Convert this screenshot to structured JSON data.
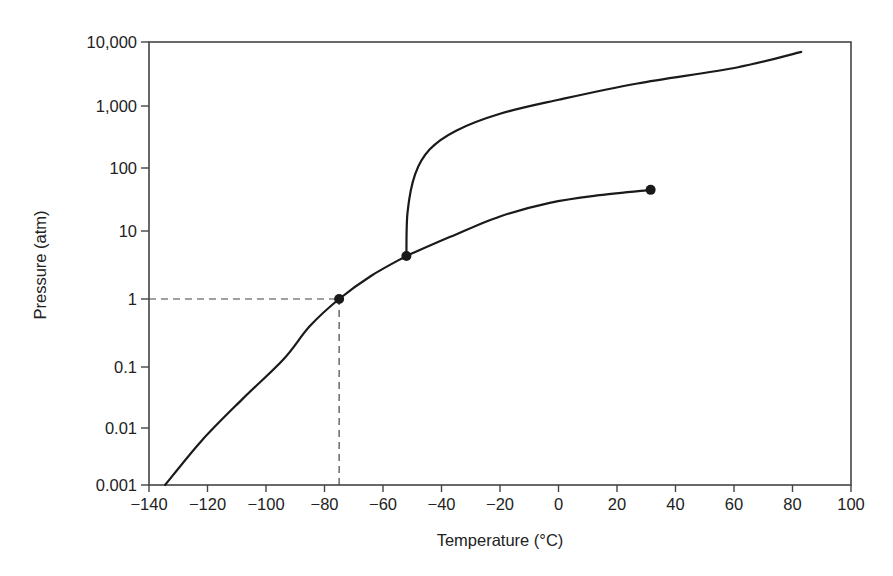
{
  "chart_data": {
    "type": "line",
    "title": "",
    "xlabel": "Temperature (°C)",
    "ylabel": "Pressure (atm)",
    "xlim": [
      -140,
      100
    ],
    "ylim": [
      0.001,
      10000
    ],
    "yscale": "log",
    "grid": false,
    "legend": null,
    "x_ticks": [
      -140,
      -120,
      -100,
      -80,
      -60,
      -40,
      -20,
      0,
      20,
      40,
      60,
      80,
      100
    ],
    "x_tick_labels": [
      "−140",
      "−120",
      "−100",
      "−80",
      "−60",
      "−40",
      "−20",
      "0",
      "20",
      "40",
      "60",
      "80",
      "100"
    ],
    "y_ticks": [
      0.001,
      0.01,
      0.1,
      1,
      10,
      100,
      1000,
      10000
    ],
    "y_tick_labels": [
      "0.001",
      "0.01",
      "0.1",
      "1",
      "10",
      "100",
      "1,000",
      "10,000"
    ],
    "series": [
      {
        "name": "Sublimation curve (solid–gas)",
        "points": [
          [
            -134.5,
            0.001
          ],
          [
            -122,
            0.006
          ],
          [
            -108,
            0.03
          ],
          [
            -94,
            0.13
          ],
          [
            -85,
            0.4
          ],
          [
            -75,
            1
          ],
          [
            -64,
            2.2
          ],
          [
            -52,
            4.3
          ]
        ]
      },
      {
        "name": "Vaporization curve (liquid–gas)",
        "points": [
          [
            -52,
            4.3
          ],
          [
            -37,
            8.2
          ],
          [
            -20,
            17
          ],
          [
            -3,
            28
          ],
          [
            14,
            37
          ],
          [
            31.5,
            45
          ]
        ]
      },
      {
        "name": "Melting curve (solid–liquid)",
        "points": [
          [
            -52,
            4.3
          ],
          [
            -51.6,
            20
          ],
          [
            -49,
            80
          ],
          [
            -44,
            200
          ],
          [
            -35,
            400
          ],
          [
            -20,
            750
          ],
          [
            0,
            1250
          ],
          [
            27,
            2250
          ],
          [
            61,
            4000
          ],
          [
            83,
            7000
          ]
        ]
      }
    ],
    "markers": [
      {
        "name": "Normal sublimation point",
        "x": -75,
        "y": 1
      },
      {
        "name": "Triple point",
        "x": -52,
        "y": 4.3
      },
      {
        "name": "Critical point",
        "x": 31.5,
        "y": 45
      }
    ],
    "reference_lines": [
      {
        "type": "horizontal-dashed",
        "y": 1,
        "from_x": -140,
        "to_x": -75
      },
      {
        "type": "vertical-dashed",
        "x": -75,
        "from_y": 0.001,
        "to_y": 1
      }
    ]
  },
  "layout": {
    "plot_left": 149,
    "plot_right": 851,
    "plot_top": 42,
    "plot_bottom": 485,
    "y_tick_px": [
      485,
      428,
      367,
      299,
      231,
      168,
      106,
      42
    ],
    "colors": {
      "line": "#1a1a1a",
      "axis": "#444444",
      "dash": "#444444",
      "text": "#222222"
    }
  }
}
